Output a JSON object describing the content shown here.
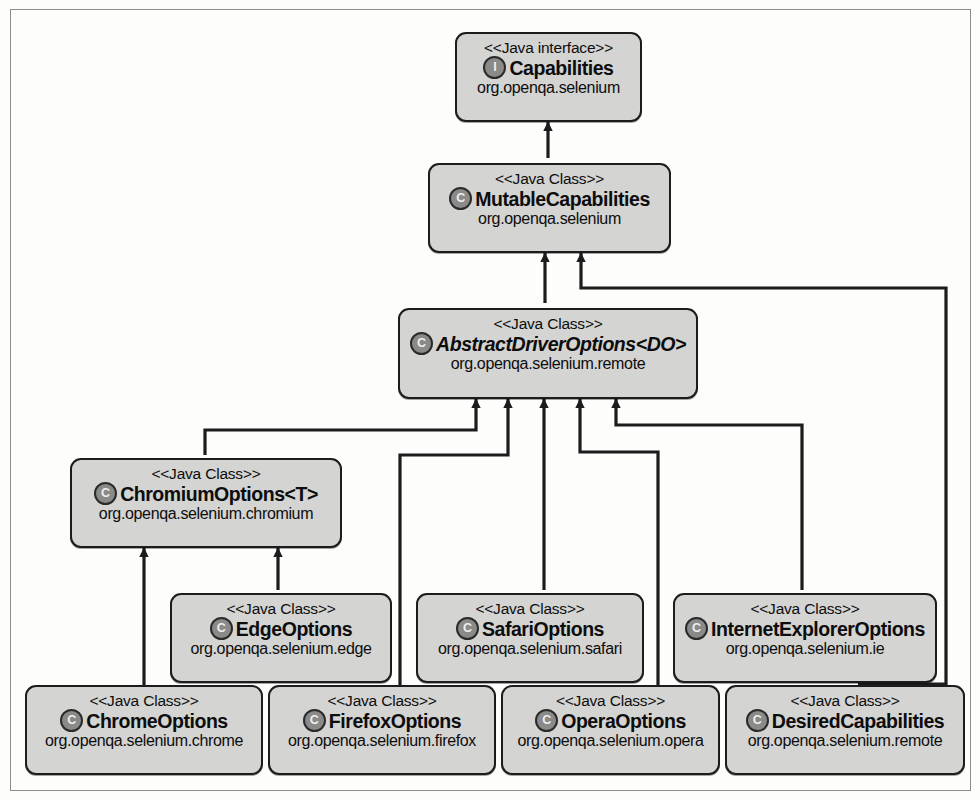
{
  "diagram": {
    "kind": "uml-class-diagram",
    "colors": {
      "node_fill": "#d4d4d2",
      "node_border": "#1c1c1c",
      "badge_fill": "#8a8a88",
      "connector": "#1c1c1c",
      "page_border": "#8d8d8d",
      "background": "#fdfdfc"
    },
    "nodes": [
      {
        "id": "capabilities",
        "stereotype": "<<Java interface>>",
        "badge": "I",
        "badge_kind": "interface-badge-icon",
        "name": "Capabilities",
        "package": "org.openqa.selenium",
        "abstract": false
      },
      {
        "id": "mutablecapabilities",
        "stereotype": "<<Java Class>>",
        "badge": "C",
        "badge_kind": "class-badge-icon",
        "name": "MutableCapabilities",
        "package": "org.openqa.selenium",
        "abstract": false
      },
      {
        "id": "abstractdriveroptions",
        "stereotype": "<<Java Class>>",
        "badge": "C",
        "badge_kind": "class-badge-icon",
        "name": "AbstractDriverOptions<DO>",
        "package": "org.openqa.selenium.remote",
        "abstract": true
      },
      {
        "id": "chromiumoptions",
        "stereotype": "<<Java Class>>",
        "badge": "C",
        "badge_kind": "class-badge-icon",
        "name": "ChromiumOptions<T>",
        "package": "org.openqa.selenium.chromium",
        "abstract": false
      },
      {
        "id": "edgeoptions",
        "stereotype": "<<Java Class>>",
        "badge": "C",
        "badge_kind": "class-badge-icon",
        "name": "EdgeOptions",
        "package": "org.openqa.selenium.edge",
        "abstract": false
      },
      {
        "id": "safarioptions",
        "stereotype": "<<Java Class>>",
        "badge": "C",
        "badge_kind": "class-badge-icon",
        "name": "SafariOptions",
        "package": "org.openqa.selenium.safari",
        "abstract": false
      },
      {
        "id": "internetexploreroptions",
        "stereotype": "<<Java Class>>",
        "badge": "C",
        "badge_kind": "class-badge-icon",
        "name": "InternetExplorerOptions",
        "package": "org.openqa.selenium.ie",
        "abstract": false
      },
      {
        "id": "chromeoptions",
        "stereotype": "<<Java Class>>",
        "badge": "C",
        "badge_kind": "class-badge-icon",
        "name": "ChromeOptions",
        "package": "org.openqa.selenium.chrome",
        "abstract": false
      },
      {
        "id": "firefoxoptions",
        "stereotype": "<<Java Class>>",
        "badge": "C",
        "badge_kind": "class-badge-icon",
        "name": "FirefoxOptions",
        "package": "org.openqa.selenium.firefox",
        "abstract": false
      },
      {
        "id": "operaoptions",
        "stereotype": "<<Java Class>>",
        "badge": "C",
        "badge_kind": "class-badge-icon",
        "name": "OperaOptions",
        "package": "org.openqa.selenium.opera",
        "abstract": false
      },
      {
        "id": "desiredcapabilities",
        "stereotype": "<<Java Class>>",
        "badge": "C",
        "badge_kind": "class-badge-icon",
        "name": "DesiredCapabilities",
        "package": "org.openqa.selenium.remote",
        "abstract": false
      }
    ],
    "edges": [
      {
        "from": "mutablecapabilities",
        "to": "capabilities",
        "type": "generalization"
      },
      {
        "from": "abstractdriveroptions",
        "to": "mutablecapabilities",
        "type": "generalization"
      },
      {
        "from": "desiredcapabilities",
        "to": "mutablecapabilities",
        "type": "generalization"
      },
      {
        "from": "chromiumoptions",
        "to": "abstractdriveroptions",
        "type": "generalization"
      },
      {
        "from": "firefoxoptions",
        "to": "abstractdriveroptions",
        "type": "generalization"
      },
      {
        "from": "safarioptions",
        "to": "abstractdriveroptions",
        "type": "generalization"
      },
      {
        "from": "operaoptions",
        "to": "abstractdriveroptions",
        "type": "generalization"
      },
      {
        "from": "internetexploreroptions",
        "to": "abstractdriveroptions",
        "type": "generalization"
      },
      {
        "from": "edgeoptions",
        "to": "chromiumoptions",
        "type": "generalization"
      },
      {
        "from": "chromeoptions",
        "to": "chromiumoptions",
        "type": "generalization"
      }
    ]
  }
}
